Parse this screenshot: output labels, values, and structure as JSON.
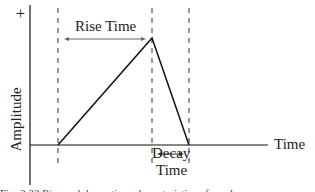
{
  "diagram": {
    "y_axis": {
      "label": "Amplitude",
      "positive_marker": "+"
    },
    "x_axis": {
      "label": "Time"
    },
    "annotations": {
      "rise_time": "Rise Time",
      "decay_time_line1": "Decay",
      "decay_time_line2": "Time"
    },
    "caption": "Fig. 2.22  Rise and decay time characteristics of a pulse"
  },
  "colors": {
    "line": "#111111",
    "dash": "#333333",
    "arrow": "#555555"
  }
}
